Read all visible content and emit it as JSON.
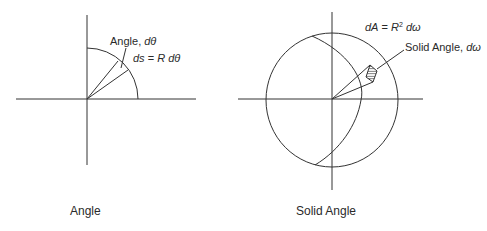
{
  "diagrams": {
    "angle": {
      "caption": "Angle",
      "label_angle_prefix": "Angle, ",
      "label_angle_symbol": "dθ",
      "label_arc_lhs": "ds",
      "label_arc_eq": " = ",
      "label_arc_R": "R",
      "label_arc_symbol": "dθ"
    },
    "solid_angle": {
      "caption": "Solid Angle",
      "label_area_lhs": "dA",
      "label_area_eq": " = ",
      "label_area_R": "R",
      "label_area_exp": "2",
      "label_area_symbol": "dω",
      "label_solid_prefix": "Solid Angle, ",
      "label_solid_symbol": "dω"
    }
  },
  "colors": {
    "stroke": "#333333",
    "text": "#2a2a2a",
    "background": "#ffffff"
  }
}
